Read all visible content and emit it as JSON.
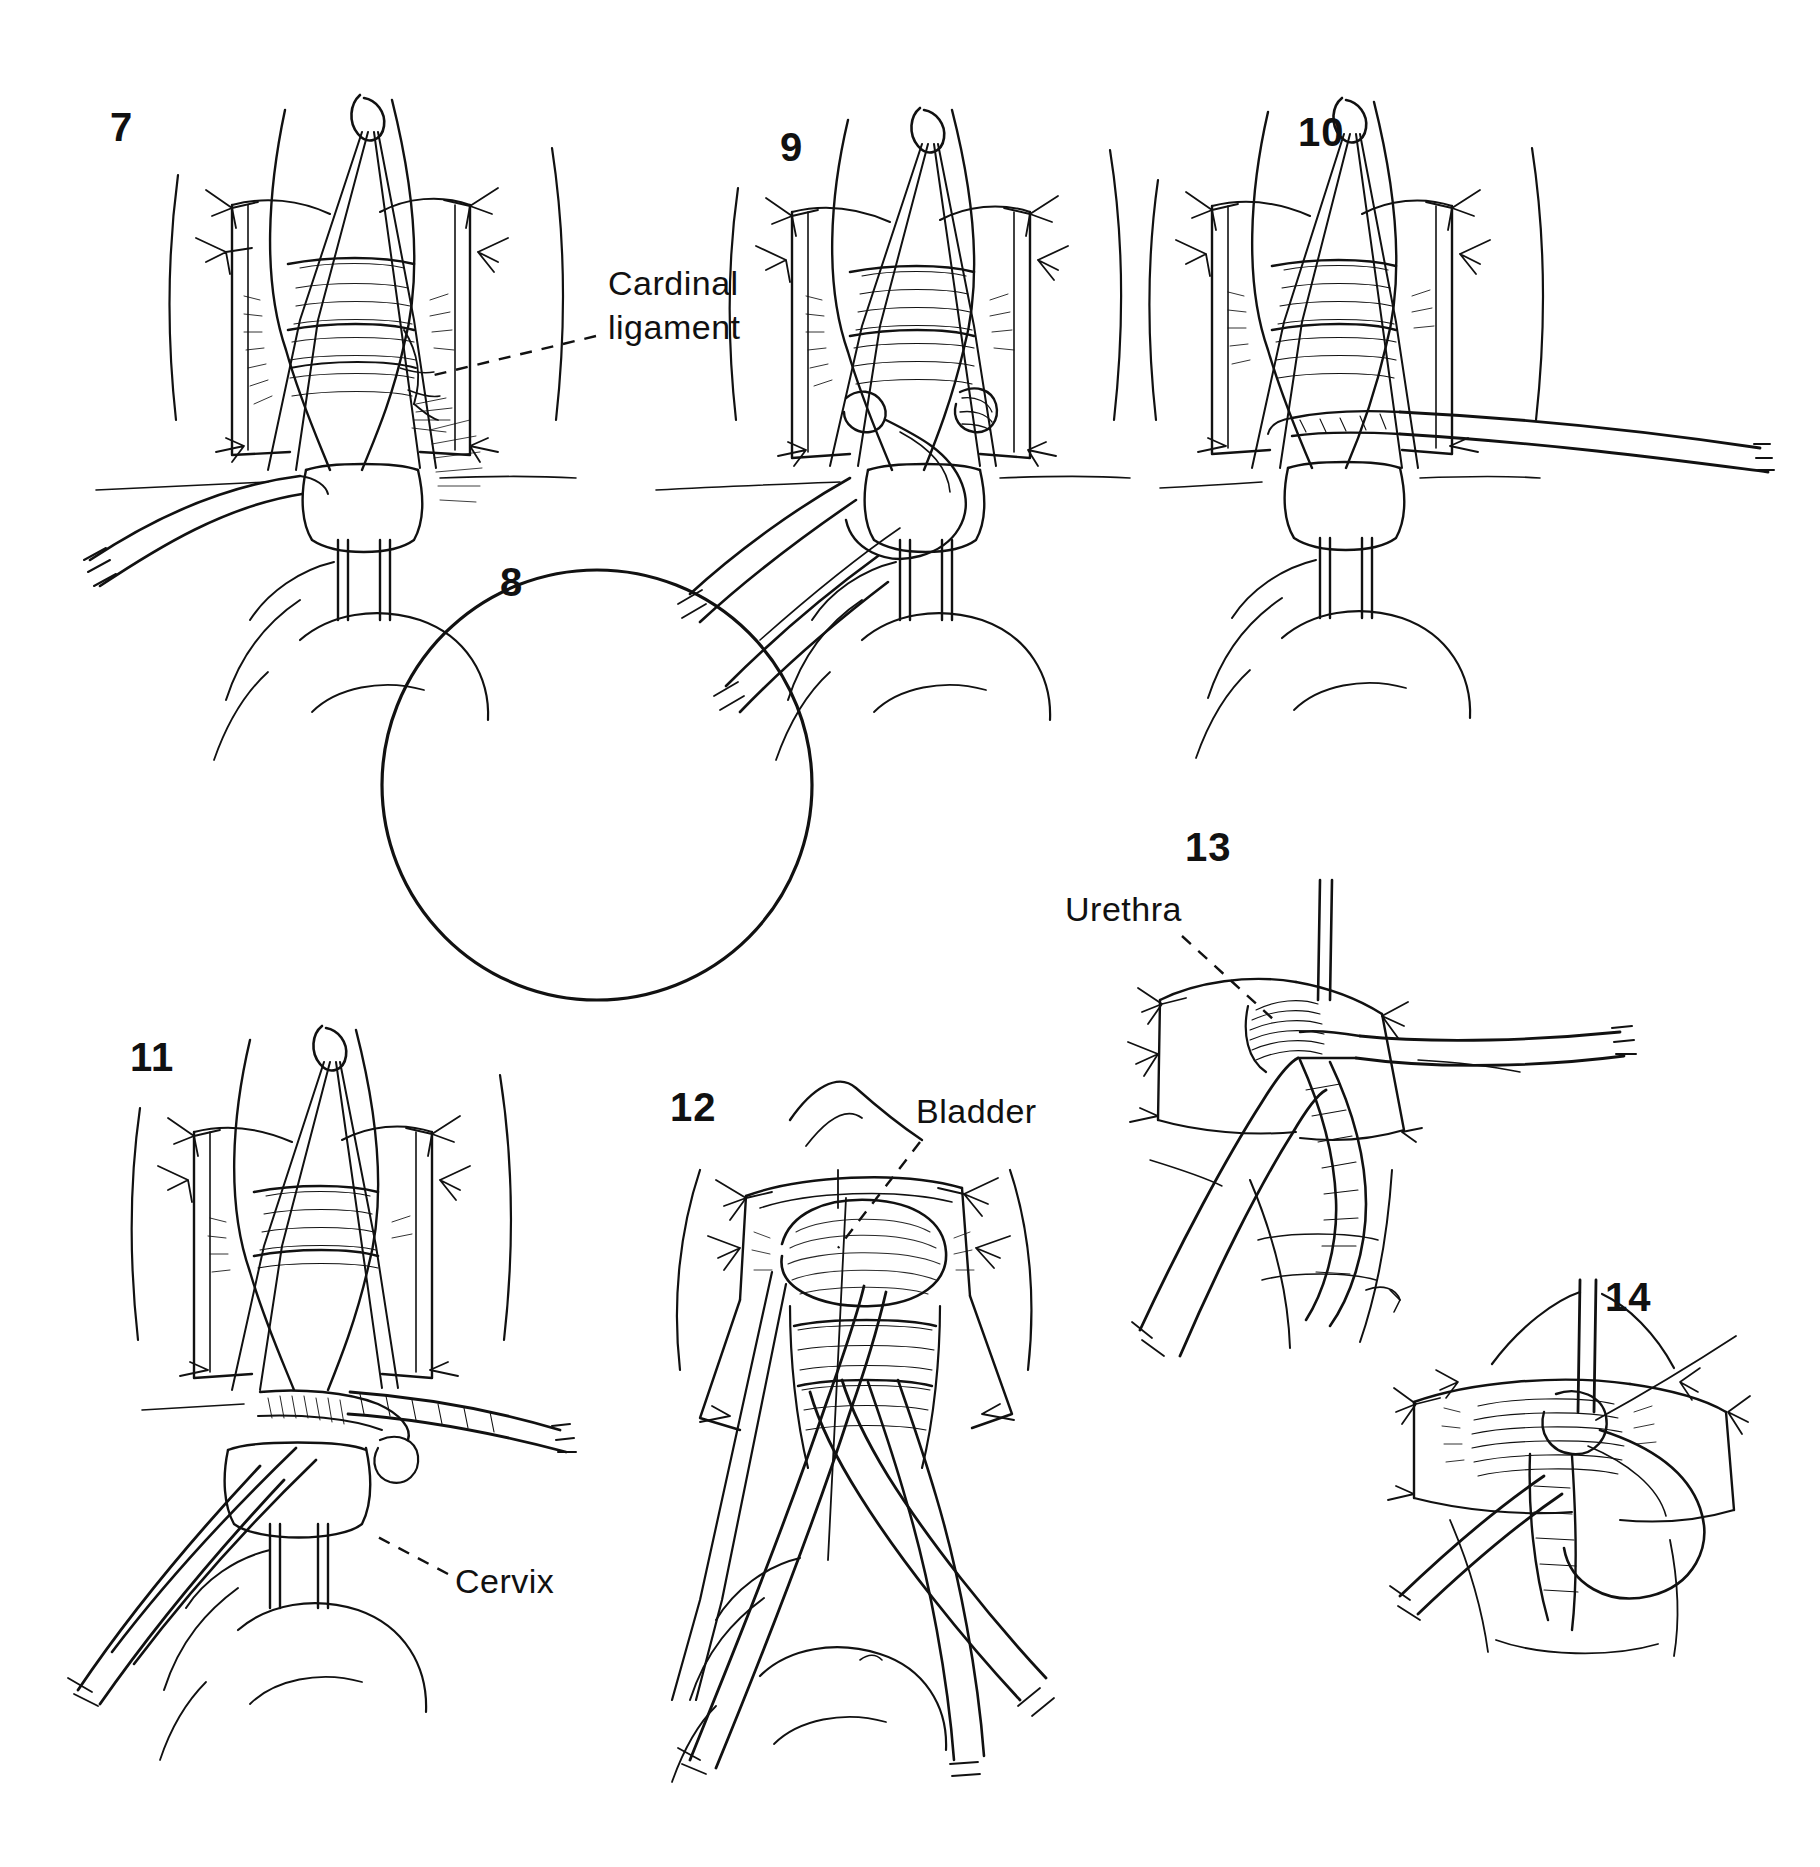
{
  "plate": {
    "title": "Vaginal hysterectomy operative steps 7-14",
    "background_color": "#ffffff",
    "ink_color": "#111111",
    "medium": "pen-and-ink line drawing",
    "width": 1820,
    "height": 1867
  },
  "figures": [
    {
      "id": "fig-7",
      "number": "7",
      "number_x": 110,
      "number_y": 105,
      "caption": "",
      "description": "Anterior view of vagina held open by retractors; traction sutures tied at lateral angles; clamp applied at left cardinal ligament base; tenaculum on cervix."
    },
    {
      "id": "fig-8",
      "number": "8",
      "number_x": 500,
      "number_y": 560,
      "caption": "",
      "description": "Circular magnified inset detail of the clamped and ligated cardinal ligament pedicle at the cervix."
    },
    {
      "id": "fig-9",
      "number": "9",
      "number_x": 780,
      "number_y": 125,
      "caption": "",
      "description": "Suture ligature being placed on the pedicle with needle holder; loop of suture hanging free."
    },
    {
      "id": "fig-10",
      "number": "10",
      "number_x": 1298,
      "number_y": 110,
      "caption": "",
      "description": "Clamp applied across the right cardinal ligament, mirror of step 7."
    },
    {
      "id": "fig-11",
      "number": "11",
      "number_x": 130,
      "number_y": 1035,
      "caption": "",
      "description": "Scissors dividing the ligament pedicle below the clamp; cervix pulled downward by tenaculum."
    },
    {
      "id": "fig-12",
      "number": "12",
      "number_x": 670,
      "number_y": 1085,
      "caption": "",
      "description": "Anterior vaginal wall opened; bladder displaced upward with retractor; forceps and scissors in field."
    },
    {
      "id": "fig-13",
      "number": "13",
      "number_x": 1185,
      "number_y": 825,
      "caption": "",
      "description": "Close-up of the anterior dissection with urethra retracted superiorly and clamp in place."
    },
    {
      "id": "fig-14",
      "number": "14",
      "number_x": 1605,
      "number_y": 1275,
      "caption": "",
      "description": "Final close-up showing closure of the anterior peritoneum / vaginal cuff with suture loop."
    }
  ],
  "annotations": [
    {
      "id": "anno-cardinal-ligament",
      "text": "Cardinal\nligament",
      "x": 608,
      "y": 262,
      "leader": {
        "x1": 596,
        "y1": 335,
        "x2": 430,
        "y2": 375,
        "style": "dashed"
      },
      "belongs_to": "fig-7"
    },
    {
      "id": "anno-urethra",
      "text": "Urethra",
      "x": 1065,
      "y": 888,
      "leader": {
        "x1": 1180,
        "y1": 935,
        "x2": 1272,
        "y2": 1018,
        "style": "dashed"
      },
      "belongs_to": "fig-13"
    },
    {
      "id": "anno-bladder",
      "text": "Bladder",
      "x": 916,
      "y": 1090,
      "leader": {
        "x1": 920,
        "y1": 1140,
        "x2": 836,
        "y2": 1248,
        "style": "dashed"
      },
      "belongs_to": "fig-12"
    },
    {
      "id": "anno-cervix",
      "text": "Cervix",
      "x": 455,
      "y": 1560,
      "leader": {
        "x1": 448,
        "y1": 1572,
        "x2": 374,
        "y2": 1535,
        "style": "dashed"
      },
      "belongs_to": "fig-11"
    }
  ],
  "labels_summary": [
    "Cardinal ligament",
    "Urethra",
    "Bladder",
    "Cervix"
  ],
  "figure_numbers": [
    "7",
    "8",
    "9",
    "10",
    "11",
    "12",
    "13",
    "14"
  ]
}
